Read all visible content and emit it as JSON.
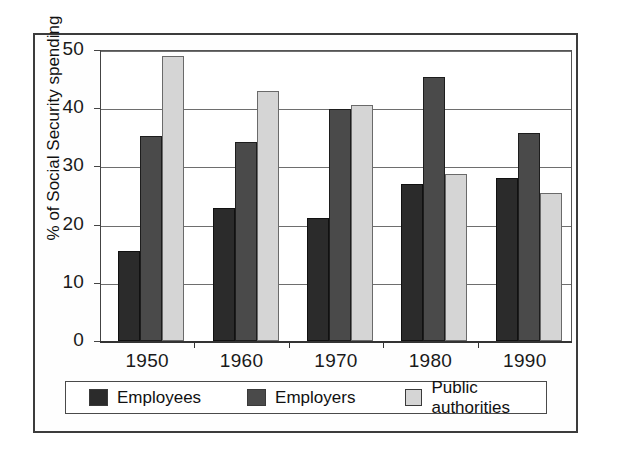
{
  "chart_data": {
    "type": "bar",
    "title": "",
    "xlabel": "",
    "ylabel": "% of Social Security spending",
    "categories": [
      "1950",
      "1960",
      "1970",
      "1980",
      "1990"
    ],
    "series": [
      {
        "name": "Employees",
        "color": "#2b2b2b",
        "values": [
          15.5,
          22.8,
          21.1,
          27.0,
          28.0
        ]
      },
      {
        "name": "Employers",
        "color": "#4a4a4a",
        "values": [
          35.2,
          34.2,
          39.8,
          45.3,
          35.8
        ]
      },
      {
        "name": "Public authorities",
        "color": "#d5d5d5",
        "values": [
          49.0,
          43.0,
          40.5,
          28.7,
          25.4
        ]
      }
    ],
    "ylim": [
      0,
      50
    ],
    "yticks": [
      0,
      10,
      20,
      30,
      40,
      50
    ],
    "ytick_labels": [
      "0",
      "10",
      "20",
      "30",
      "40",
      "50"
    ],
    "grid": "horizontal",
    "legend_position": "bottom"
  },
  "figure": {
    "frame": "rectangular-border",
    "background": "#ffffff",
    "axis_color": "#333333",
    "grid_color": "#6e6e6e"
  }
}
